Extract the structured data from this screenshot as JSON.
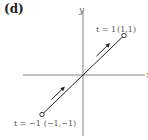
{
  "panel_label": "(d)",
  "axes": {
    "x_label": "x",
    "y_label": "y"
  },
  "curve": {
    "description": "line segment from (-1,-1) to (1,1)",
    "start": {
      "t_label": "t = −1",
      "coords": "(−1,−1)",
      "x": -1,
      "y": -1
    },
    "end": {
      "t_label": "t = 1",
      "coords": "(1,1)",
      "x": 1,
      "y": 1
    },
    "direction_arrows": 2
  },
  "colors": {
    "axis": "#666666",
    "line": "#222222",
    "text": "#555555"
  }
}
